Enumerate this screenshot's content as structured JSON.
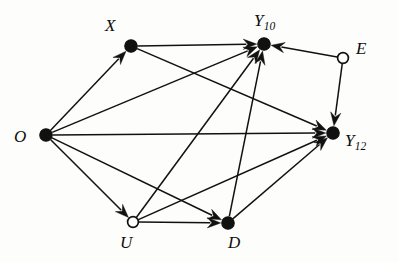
{
  "figure": {
    "kind": "directed-acyclic-graph",
    "title": "",
    "background_color": "#fdfdfc",
    "line_color": "#111111",
    "node_fill_observed": "#111111",
    "node_fill_unobserved": "#ffffff",
    "width": 398,
    "height": 262
  },
  "nodes": [
    {
      "id": "O",
      "label": "O",
      "subscript": "",
      "type": "filled",
      "x": 46,
      "y": 135,
      "r": 6.2,
      "label_x": 14,
      "label_y": 128
    },
    {
      "id": "X",
      "label": "X",
      "subscript": "",
      "type": "filled",
      "x": 131,
      "y": 46,
      "r": 6.2,
      "label_x": 105,
      "label_y": 17
    },
    {
      "id": "Y10",
      "label": "Y",
      "subscript": "10",
      "type": "filled",
      "x": 264,
      "y": 44,
      "r": 6.2,
      "label_x": 254,
      "label_y": 12
    },
    {
      "id": "E",
      "label": "E",
      "subscript": "",
      "type": "hollow",
      "x": 343,
      "y": 58,
      "r": 5.4,
      "label_x": 356,
      "label_y": 40
    },
    {
      "id": "Y12",
      "label": "Y",
      "subscript": "12",
      "type": "filled",
      "x": 333,
      "y": 133,
      "r": 6.2,
      "label_x": 345,
      "label_y": 132
    },
    {
      "id": "U",
      "label": "U",
      "subscript": "",
      "type": "hollow",
      "x": 133,
      "y": 222,
      "r": 5.4,
      "label_x": 120,
      "label_y": 234
    },
    {
      "id": "D",
      "label": "D",
      "subscript": "",
      "type": "filled",
      "x": 228,
      "y": 223,
      "r": 6.2,
      "label_x": 228,
      "label_y": 234
    }
  ],
  "edges": [
    {
      "from": "O",
      "to": "X",
      "name": "edge-o-x"
    },
    {
      "from": "O",
      "to": "Y10",
      "name": "edge-o-y10"
    },
    {
      "from": "O",
      "to": "Y12",
      "name": "edge-o-y12"
    },
    {
      "from": "O",
      "to": "U",
      "name": "edge-o-u"
    },
    {
      "from": "O",
      "to": "D",
      "name": "edge-o-d"
    },
    {
      "from": "X",
      "to": "Y10",
      "name": "edge-x-y10"
    },
    {
      "from": "X",
      "to": "Y12",
      "name": "edge-x-y12"
    },
    {
      "from": "E",
      "to": "Y10",
      "name": "edge-e-y10"
    },
    {
      "from": "E",
      "to": "Y12",
      "name": "edge-e-y12"
    },
    {
      "from": "U",
      "to": "D",
      "name": "edge-u-d"
    },
    {
      "from": "U",
      "to": "Y10",
      "name": "edge-u-y10"
    },
    {
      "from": "U",
      "to": "Y12",
      "name": "edge-u-y12"
    },
    {
      "from": "D",
      "to": "Y10",
      "name": "edge-d-y10"
    },
    {
      "from": "D",
      "to": "Y12",
      "name": "edge-d-y12"
    }
  ]
}
